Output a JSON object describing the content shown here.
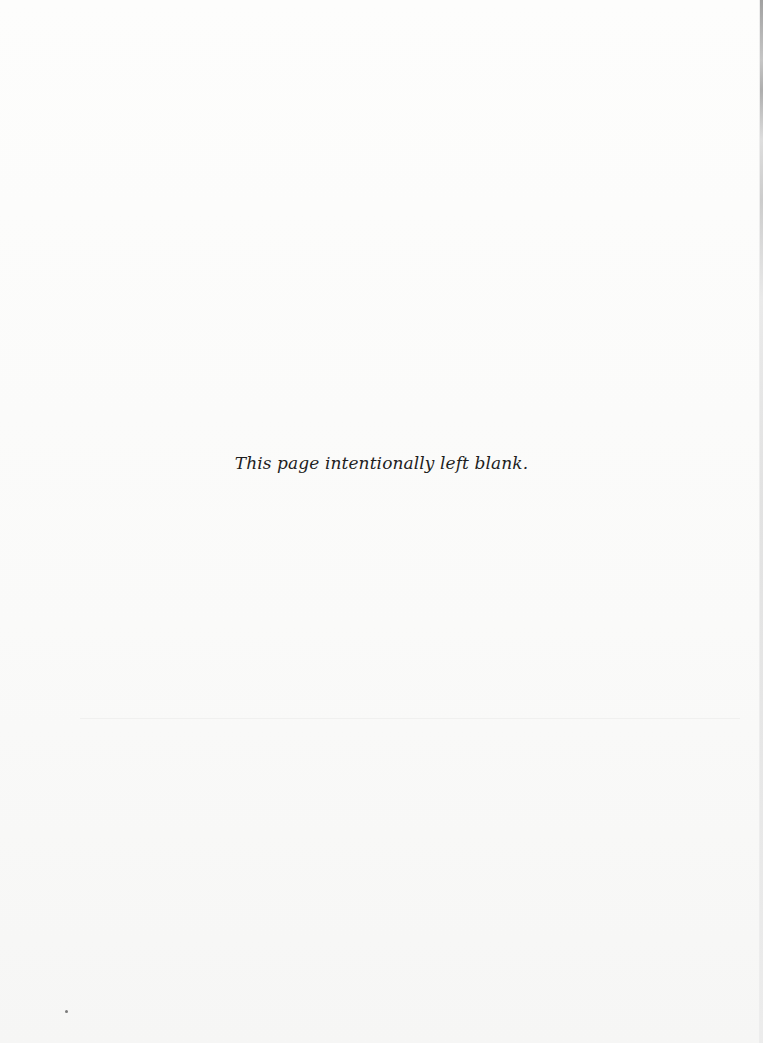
{
  "page": {
    "notice": "This page intentionally left blank."
  }
}
